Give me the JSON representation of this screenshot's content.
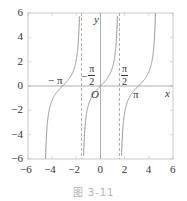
{
  "chart_data": {
    "type": "line",
    "title": "",
    "caption": "图 3-11",
    "xlabel": "x",
    "ylabel": "y",
    "xlim": [
      -6,
      6
    ],
    "ylim": [
      -6,
      6
    ],
    "x_ticks": [
      -6,
      -4,
      -2,
      0,
      2,
      4,
      6
    ],
    "x_tick_labels": [
      "-6",
      "-4",
      "-2",
      "0",
      "2",
      "4",
      "6"
    ],
    "y_ticks": [
      -6,
      -4,
      -2,
      0,
      2,
      4,
      6
    ],
    "y_tick_labels": [
      "-6",
      "-4",
      "-2",
      "0",
      "2",
      "4",
      "6"
    ],
    "grid": false,
    "function": "y = tan(x)",
    "series": [
      {
        "name": "tan(x) branch 1",
        "domain": [
          -4.712,
          -1.571
        ]
      },
      {
        "name": "tan(x) branch 2",
        "domain": [
          -1.571,
          1.571
        ]
      },
      {
        "name": "tan(x) branch 3",
        "domain": [
          1.571,
          4.712
        ]
      }
    ],
    "asymptotes": [
      -1.5708,
      1.5708
    ],
    "annotations": [
      {
        "text": "−π",
        "x": -3.1416,
        "y": 0
      },
      {
        "text": "−π/2",
        "x": -1.5708,
        "y": 0
      },
      {
        "text": "π/2",
        "x": 1.5708,
        "y": 0
      },
      {
        "text": "O",
        "x": 0,
        "y": 0
      },
      {
        "text": "π",
        "x": 3.1416,
        "y": 0
      }
    ],
    "colors": {
      "curve": "#8a8a8a",
      "axis": "#9a9a9a",
      "asymptote": "#9a9a9a",
      "frame": "#bdbdbd"
    }
  },
  "labels": {
    "y_axis": "y",
    "x_axis": "x",
    "origin": "O",
    "neg_pi": "− π",
    "pi": "π",
    "neg_sign": "−",
    "pi_num": "π",
    "two_den": "2"
  },
  "caption": "图 3-11"
}
